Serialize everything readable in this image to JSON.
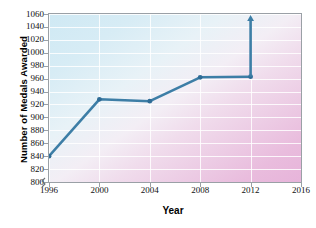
{
  "chart_data": {
    "type": "line",
    "title": "",
    "xlabel": "Year",
    "ylabel": "Number of Medals Awarded",
    "x": [
      1996,
      2000,
      2004,
      2008,
      2012
    ],
    "values": [
      840,
      928,
      925,
      962,
      963
    ],
    "categories": [
      "1996",
      "2000",
      "2004",
      "2008",
      "2012"
    ],
    "xticks": [
      "1996",
      "2000",
      "2004",
      "2008",
      "2012",
      "2016"
    ],
    "xlim": [
      1996,
      2016
    ],
    "yticks": [
      "800",
      "820",
      "840",
      "860",
      "880",
      "900",
      "920",
      "940",
      "960",
      "980",
      "1000",
      "1020",
      "1040",
      "1060"
    ],
    "ylim": [
      800,
      1060
    ],
    "grid": true,
    "legend": "none",
    "annotations": [
      {
        "name": "upward-arrow-at-2012",
        "x": 2012,
        "from": 963,
        "to": 1060,
        "text": ""
      }
    ],
    "axis_break": "y-axis break below 800",
    "series_color": "#3d7ea6",
    "marker_color": "#2f6c96",
    "gradient_start": "#cfe9f4",
    "gradient_end": "#e7b4da"
  },
  "accessibility": {
    "chart_name": "medals-awarded-line-chart"
  }
}
